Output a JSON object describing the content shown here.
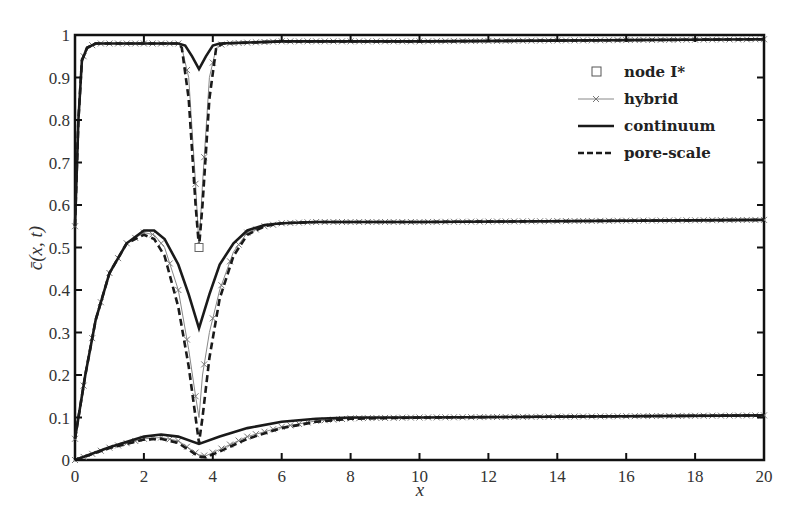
{
  "chart_data": {
    "type": "line",
    "title": "",
    "xlabel": "x",
    "ylabel": "c̄(x, t)",
    "xlim": [
      0,
      20
    ],
    "ylim": [
      0,
      1
    ],
    "grid": false,
    "legend_position": "upper right",
    "xticks": [
      "0",
      "2",
      "4",
      "6",
      "8",
      "10",
      "12",
      "14",
      "16",
      "18",
      "20"
    ],
    "yticks": [
      "0",
      "0.1",
      "0.2",
      "0.3",
      "0.4",
      "0.5",
      "0.6",
      "0.7",
      "0.8",
      "0.9",
      "1"
    ],
    "legend": [
      {
        "label": "node I*",
        "style": "square-marker"
      },
      {
        "label": "hybrid",
        "style": "thin-gray-line-x-markers"
      },
      {
        "label": "continuum",
        "style": "solid-black"
      },
      {
        "label": "pore-scale",
        "style": "dashed-black"
      }
    ],
    "node_I_star": {
      "x": 3.6,
      "y": 0.5
    },
    "series": [
      {
        "name": "continuum",
        "profile": "late-time",
        "x": [
          0,
          0.1,
          0.2,
          0.35,
          0.6,
          1,
          3,
          3.2,
          3.4,
          3.6,
          3.8,
          4.0,
          4.2,
          6,
          10,
          20
        ],
        "y": [
          0.55,
          0.8,
          0.94,
          0.97,
          0.98,
          0.98,
          0.98,
          0.975,
          0.95,
          0.92,
          0.95,
          0.975,
          0.98,
          0.985,
          0.985,
          0.99
        ]
      },
      {
        "name": "pore-scale",
        "profile": "late-time",
        "x": [
          0,
          0.1,
          0.2,
          0.35,
          0.6,
          1,
          3,
          3.1,
          3.3,
          3.5,
          3.6,
          3.7,
          3.9,
          4.1,
          4.3,
          6,
          10,
          20
        ],
        "y": [
          0.55,
          0.8,
          0.94,
          0.97,
          0.98,
          0.98,
          0.98,
          0.97,
          0.85,
          0.6,
          0.5,
          0.6,
          0.85,
          0.97,
          0.98,
          0.985,
          0.985,
          0.99
        ]
      },
      {
        "name": "hybrid",
        "profile": "late-time",
        "x": [
          0,
          0.1,
          0.2,
          0.35,
          0.6,
          1,
          3,
          3.1,
          3.3,
          3.5,
          3.6,
          3.7,
          3.9,
          4.1,
          4.3,
          6,
          10,
          20
        ],
        "y": [
          0.55,
          0.8,
          0.94,
          0.97,
          0.98,
          0.98,
          0.98,
          0.97,
          0.9,
          0.65,
          0.5,
          0.65,
          0.9,
          0.97,
          0.98,
          0.985,
          0.985,
          0.99
        ]
      },
      {
        "name": "continuum",
        "profile": "mid-time",
        "x": [
          0,
          0.3,
          0.6,
          1,
          1.5,
          2,
          2.3,
          2.6,
          3,
          3.3,
          3.6,
          3.9,
          4.2,
          4.6,
          5,
          5.5,
          6,
          7,
          10,
          20
        ],
        "y": [
          0.05,
          0.2,
          0.33,
          0.44,
          0.51,
          0.54,
          0.54,
          0.52,
          0.46,
          0.39,
          0.31,
          0.39,
          0.46,
          0.51,
          0.54,
          0.553,
          0.557,
          0.56,
          0.56,
          0.565
        ]
      },
      {
        "name": "pore-scale",
        "profile": "mid-time",
        "x": [
          0,
          0.3,
          0.6,
          1,
          1.5,
          2,
          2.3,
          2.6,
          3,
          3.3,
          3.5,
          3.6,
          3.7,
          3.9,
          4.2,
          4.6,
          5,
          5.5,
          6,
          7,
          10,
          20
        ],
        "y": [
          0.05,
          0.2,
          0.33,
          0.44,
          0.51,
          0.53,
          0.52,
          0.48,
          0.36,
          0.22,
          0.1,
          0.04,
          0.1,
          0.24,
          0.38,
          0.48,
          0.53,
          0.55,
          0.557,
          0.56,
          0.56,
          0.565
        ]
      },
      {
        "name": "hybrid",
        "profile": "mid-time",
        "x": [
          0,
          0.3,
          0.6,
          1,
          1.5,
          2,
          2.3,
          2.6,
          3,
          3.3,
          3.5,
          3.6,
          3.7,
          3.9,
          4.2,
          4.6,
          5,
          5.5,
          6,
          7,
          10,
          20
        ],
        "y": [
          0.05,
          0.2,
          0.33,
          0.44,
          0.51,
          0.535,
          0.53,
          0.5,
          0.4,
          0.26,
          0.15,
          0.1,
          0.2,
          0.3,
          0.4,
          0.49,
          0.535,
          0.55,
          0.557,
          0.56,
          0.56,
          0.565
        ]
      },
      {
        "name": "continuum",
        "profile": "early-time",
        "x": [
          0,
          1,
          2,
          2.5,
          3,
          3.6,
          4.2,
          5,
          6,
          7,
          8,
          10,
          20
        ],
        "y": [
          0,
          0.03,
          0.055,
          0.06,
          0.055,
          0.038,
          0.055,
          0.075,
          0.09,
          0.097,
          0.1,
          0.1,
          0.105
        ]
      },
      {
        "name": "pore-scale",
        "profile": "early-time",
        "x": [
          0,
          1,
          2,
          2.5,
          3,
          3.6,
          3.8,
          4.2,
          5,
          6,
          7,
          8,
          10,
          20
        ],
        "y": [
          0,
          0.028,
          0.048,
          0.05,
          0.04,
          0.008,
          0.006,
          0.02,
          0.05,
          0.075,
          0.09,
          0.097,
          0.1,
          0.105
        ]
      },
      {
        "name": "hybrid",
        "profile": "early-time",
        "x": [
          0,
          1,
          2,
          2.5,
          3,
          3.6,
          3.8,
          4.2,
          5,
          6,
          7,
          8,
          10,
          20
        ],
        "y": [
          0,
          0.029,
          0.05,
          0.053,
          0.045,
          0.012,
          0.01,
          0.025,
          0.055,
          0.078,
          0.092,
          0.098,
          0.1,
          0.105
        ]
      }
    ]
  }
}
